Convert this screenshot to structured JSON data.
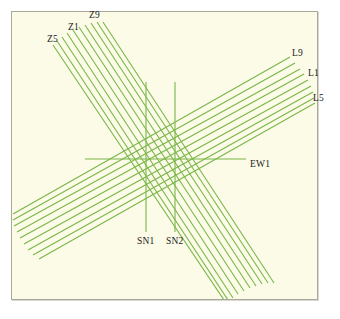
{
  "figure": {
    "kind": "survey-line-layout-diagram",
    "background_color": "#fbfbe8",
    "frame_color": "#a8a89c",
    "line_color": "#7ab648",
    "label_color": "#1a1a1a",
    "canvas": {
      "width": 340,
      "height": 319
    },
    "frame": {
      "x": 11,
      "y": 11,
      "width": 307,
      "height": 289
    }
  },
  "labels": {
    "z5": "Z5",
    "z1": "Z1",
    "z9": "Z9",
    "l9": "L9",
    "l1": "L1",
    "l5": "L5",
    "ew1": "EW1",
    "sn1": "SN1",
    "sn2": "SN2"
  },
  "label_positions": {
    "z5": {
      "x": 47,
      "y": 34
    },
    "z1": {
      "x": 68,
      "y": 22
    },
    "z9": {
      "x": 89,
      "y": 10
    },
    "l9": {
      "x": 292,
      "y": 48
    },
    "l1": {
      "x": 308,
      "y": 68
    },
    "l5": {
      "x": 313,
      "y": 93
    },
    "ew1": {
      "x": 250,
      "y": 159
    },
    "sn1": {
      "x": 137,
      "y": 236
    },
    "sn2": {
      "x": 166,
      "y": 236
    }
  },
  "chart_data": {
    "type": "line",
    "title": "",
    "xlabel": "",
    "ylabel": "",
    "grid": false,
    "legend_position": "inline-endpoint-labels",
    "line_color": "#7ab648",
    "line_width": 1.1,
    "bundles": [
      {
        "name": "Z-lines",
        "orientation": "NW-SE diagonal",
        "label_start": "Z9",
        "label_mid": "Z1",
        "label_end": "Z5",
        "count": 10,
        "lines": [
          {
            "id": "Z9",
            "x1": 103,
            "y1": 22,
            "x2": 274,
            "y2": 283
          },
          {
            "id": "Z8",
            "x1": 97,
            "y1": 22,
            "x2": 268,
            "y2": 283
          },
          {
            "id": "Z7",
            "x1": 91,
            "y1": 23,
            "x2": 262,
            "y2": 284
          },
          {
            "id": "Z6",
            "x1": 85,
            "y1": 25,
            "x2": 256,
            "y2": 286
          },
          {
            "id": "Z5b",
            "x1": 79,
            "y1": 27,
            "x2": 250,
            "y2": 288
          },
          {
            "id": "Z4",
            "x1": 73,
            "y1": 30,
            "x2": 244,
            "y2": 291
          },
          {
            "id": "Z3",
            "x1": 67,
            "y1": 33,
            "x2": 238,
            "y2": 294
          },
          {
            "id": "Z2",
            "x1": 62,
            "y1": 37,
            "x2": 233,
            "y2": 298
          },
          {
            "id": "Z1",
            "x1": 57,
            "y1": 41,
            "x2": 228,
            "y2": 300
          },
          {
            "id": "Z0",
            "x1": 53,
            "y1": 45,
            "x2": 224,
            "y2": 300
          }
        ]
      },
      {
        "name": "L-lines",
        "orientation": "SW-NE diagonal",
        "label_start": "L9",
        "label_mid": "L1",
        "label_end": "L5",
        "count": 9,
        "lines": [
          {
            "id": "L9",
            "x1": 13,
            "y1": 214,
            "x2": 290,
            "y2": 57
          },
          {
            "id": "L8",
            "x1": 13,
            "y1": 220,
            "x2": 295,
            "y2": 63
          },
          {
            "id": "L7",
            "x1": 14,
            "y1": 226,
            "x2": 300,
            "y2": 69
          },
          {
            "id": "L6",
            "x1": 17,
            "y1": 232,
            "x2": 304,
            "y2": 74
          },
          {
            "id": "L5b",
            "x1": 20,
            "y1": 238,
            "x2": 308,
            "y2": 80
          },
          {
            "id": "L4",
            "x1": 24,
            "y1": 244,
            "x2": 311,
            "y2": 86
          },
          {
            "id": "L3",
            "x1": 28,
            "y1": 250,
            "x2": 313,
            "y2": 92
          },
          {
            "id": "L2",
            "x1": 33,
            "y1": 255,
            "x2": 314,
            "y2": 98
          },
          {
            "id": "L1",
            "x1": 39,
            "y1": 259,
            "x2": 315,
            "y2": 103
          }
        ]
      },
      {
        "name": "EW-lines",
        "orientation": "horizontal",
        "label_end": "EW1",
        "count": 1,
        "lines": [
          {
            "id": "EW1",
            "x1": 85,
            "y1": 159,
            "x2": 246,
            "y2": 159
          }
        ]
      },
      {
        "name": "SN-lines",
        "orientation": "vertical",
        "label_a": "SN1",
        "label_b": "SN2",
        "count": 2,
        "lines": [
          {
            "id": "SN1",
            "x1": 146,
            "y1": 82,
            "x2": 146,
            "y2": 232
          },
          {
            "id": "SN2",
            "x1": 175,
            "y1": 82,
            "x2": 175,
            "y2": 232
          }
        ]
      }
    ]
  }
}
